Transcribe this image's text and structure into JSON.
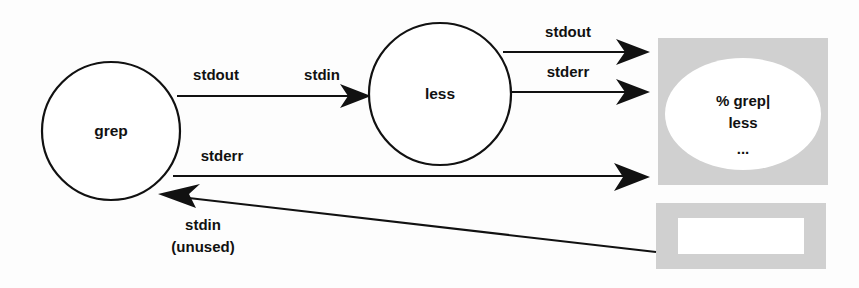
{
  "diagram": {
    "background_color": "#fdfdfd",
    "stroke_color": "#111111",
    "terminal_fill": "#d0d0d0",
    "nodes": [
      {
        "id": "grep",
        "label": "grep",
        "cx": 111,
        "cy": 131,
        "r": 69
      },
      {
        "id": "less",
        "label": "less",
        "cx": 440,
        "cy": 94,
        "r": 71
      }
    ],
    "edges": [
      {
        "id": "grep-stdout",
        "source_label": "stdout",
        "target_label": "stdin",
        "from": "grep",
        "to": "less"
      },
      {
        "id": "less-stdout",
        "label": "stdout",
        "from": "less",
        "to": "terminal"
      },
      {
        "id": "less-stderr",
        "label": "stderr",
        "from": "less",
        "to": "terminal"
      },
      {
        "id": "grep-stderr",
        "label": "stderr",
        "from": "grep",
        "to": "terminal"
      },
      {
        "id": "terminal-stdin",
        "label": "stdin",
        "sublabel": "(unused)",
        "from": "keyboard",
        "to": "grep"
      }
    ],
    "labels": {
      "grep_stdout": "stdout",
      "less_stdin": "stdin",
      "less_stdout": "stdout",
      "less_stderr": "stderr",
      "grep_stderr": "stderr",
      "grep_stdin": "stdin",
      "grep_stdin_note": "(unused)"
    },
    "terminal": {
      "id": "terminal-window",
      "lines": [
        "% grep|",
        "less",
        "..."
      ]
    },
    "keyboard": {
      "id": "keyboard-device",
      "label": ""
    }
  }
}
